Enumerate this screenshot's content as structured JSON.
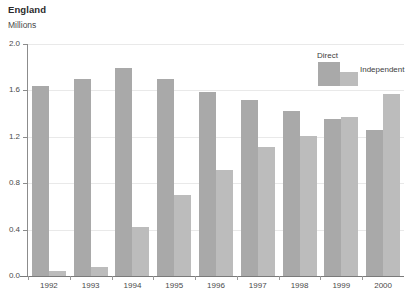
{
  "chart_data": {
    "type": "bar",
    "title": "England",
    "subtitle": "Millions",
    "xlabel": "",
    "ylabel": "Millions",
    "ylim": [
      0.0,
      2.0
    ],
    "yticks": [
      "0.0",
      "0.4",
      "0.8",
      "1.2",
      "1.6",
      "2.0"
    ],
    "grid": true,
    "legend_position": "top-right",
    "categories": [
      "1992",
      "1993",
      "1994",
      "1995",
      "1996",
      "1997",
      "1998",
      "1999",
      "2000"
    ],
    "series": [
      {
        "name": "Direct",
        "color": "#a9a9a9",
        "values": [
          1.64,
          1.7,
          1.79,
          1.7,
          1.59,
          1.52,
          1.42,
          1.35,
          1.26
        ]
      },
      {
        "name": "Independent",
        "color": "#bcbcbc",
        "values": [
          0.04,
          0.08,
          0.42,
          0.7,
          0.91,
          1.11,
          1.21,
          1.37,
          1.57
        ]
      }
    ]
  }
}
